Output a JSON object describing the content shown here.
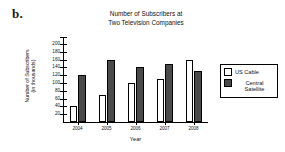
{
  "problem_label": "b.",
  "legend": {
    "position": "right",
    "entries": [
      {
        "label": "US Cable",
        "color": "#ffffff"
      },
      {
        "label": "Central\nSatellite",
        "color": "#4a4a4a"
      }
    ]
  },
  "chart_data": {
    "type": "bar",
    "title": "Number of Subscribers at\nTwo Television Companies",
    "xlabel": "Year",
    "ylabel": "Number of Subscribers\n(in thousands)",
    "categories": [
      "2004",
      "2005",
      "2006",
      "2007",
      "2008"
    ],
    "series": [
      {
        "name": "US Cable",
        "color": "#ffffff",
        "values": [
          40,
          70,
          100,
          110,
          160
        ]
      },
      {
        "name": "Central Satellite",
        "color": "#4a4a4a",
        "values": [
          120,
          160,
          140,
          150,
          130
        ]
      }
    ],
    "ylim": [
      0,
      200
    ],
    "yticks": [
      20,
      40,
      60,
      80,
      100,
      120,
      140,
      160,
      180,
      200
    ],
    "ytick_labels": [
      "20",
      "40",
      "60",
      "80",
      "100",
      "120",
      "140",
      "160",
      "180",
      "200"
    ],
    "grid": false
  }
}
